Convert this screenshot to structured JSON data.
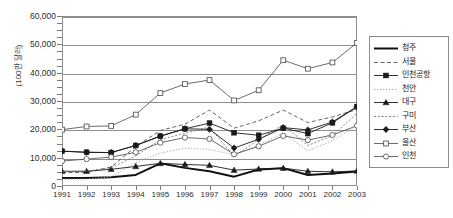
{
  "chart_data": {
    "type": "line",
    "title": "",
    "xlabel": "",
    "ylabel": "(100만 달러)",
    "categories": [
      "1991",
      "1992",
      "1993",
      "1994",
      "1995",
      "1996",
      "1997",
      "1998",
      "1999",
      "2000",
      "2001",
      "2002",
      "2003"
    ],
    "ylim": [
      0,
      60000
    ],
    "ytick_labels": [
      "0",
      "10,000",
      "20,000",
      "30,000",
      "40,000",
      "50,000",
      "60,000"
    ],
    "ytick_values": [
      0,
      10000,
      20000,
      30000,
      40000,
      50000,
      60000
    ],
    "grid": "horizontal",
    "legend_position": "right",
    "series": [
      {
        "name": "청주",
        "style": "solid-thick",
        "marker": "none",
        "color": "#111111",
        "values": [
          2800,
          2800,
          3100,
          3900,
          8000,
          6400,
          5200,
          3300,
          5800,
          6300,
          3900,
          4400,
          5100
        ]
      },
      {
        "name": "서울",
        "style": "dashed",
        "marker": "none",
        "color": "#555555",
        "values": [
          4700,
          4800,
          6700,
          13900,
          19600,
          21800,
          26800,
          20400,
          23000,
          26800,
          22400,
          24400,
          27000
        ]
      },
      {
        "name": "인천공항",
        "style": "solid",
        "marker": "filled-square",
        "color": "#1a1a1a",
        "values": [
          12300,
          11900,
          11800,
          14300,
          17600,
          20200,
          22200,
          18800,
          17900,
          20400,
          18500,
          22300,
          28000
        ]
      },
      {
        "name": "천안",
        "style": "dotted-light",
        "marker": "none",
        "color": "#9a9a9a",
        "values": [
          2400,
          2500,
          3200,
          8300,
          11600,
          13400,
          12900,
          11000,
          14500,
          18600,
          12400,
          16000,
          21400
        ]
      },
      {
        "name": "대구",
        "style": "solid",
        "marker": "filled-triangle",
        "color": "#1a1a1a",
        "values": [
          5200,
          5200,
          5900,
          6900,
          8000,
          7600,
          7300,
          5600,
          6000,
          6300,
          5200,
          5000,
          5300
        ]
      },
      {
        "name": "구미",
        "style": "dotted",
        "marker": "none",
        "color": "#777777",
        "values": [
          5000,
          5300,
          6400,
          10600,
          16400,
          18600,
          20800,
          10500,
          16300,
          21600,
          14300,
          17800,
          25600
        ]
      },
      {
        "name": "부산",
        "style": "solid",
        "marker": "filled-diamond",
        "color": "#1a1a1a",
        "values": [
          12300,
          11900,
          11800,
          14300,
          17600,
          20200,
          20000,
          13400,
          16500,
          20600,
          19800,
          22600,
          28000
        ]
      },
      {
        "name": "울산",
        "style": "solid",
        "marker": "open-square",
        "color": "#5a5a5a",
        "values": [
          19900,
          21000,
          21200,
          25200,
          32800,
          36000,
          37400,
          30200,
          33800,
          44400,
          41400,
          43600,
          50500
        ]
      },
      {
        "name": "인천",
        "style": "solid",
        "marker": "open-circle",
        "color": "#5a5a5a",
        "values": [
          8800,
          9500,
          10200,
          11900,
          15300,
          17100,
          16600,
          11200,
          14000,
          17700,
          16200,
          18000,
          21300
        ]
      }
    ]
  }
}
